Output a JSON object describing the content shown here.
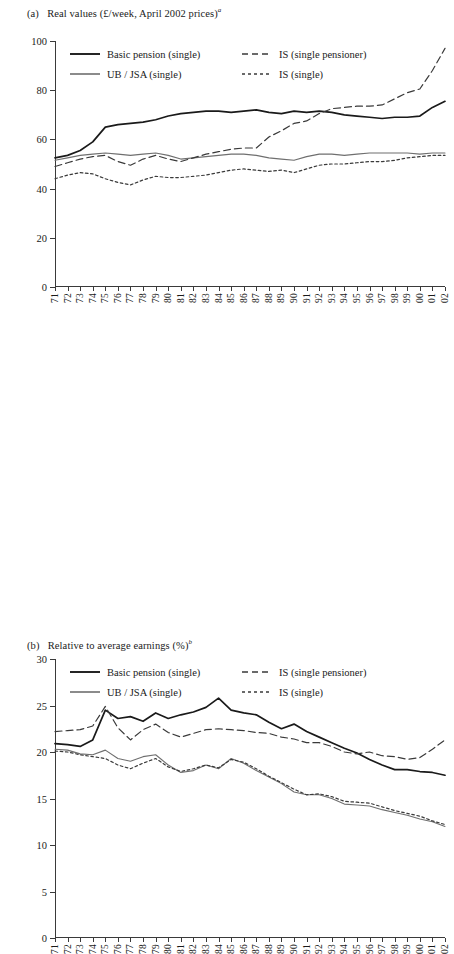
{
  "figure": {
    "panel_a_label": "(a)",
    "panel_a_title": "Real values (£/week, April 2002 prices)",
    "panel_a_superscript": "a",
    "panel_b_label": "(b)",
    "panel_b_title": "Relative to average earnings (%)",
    "panel_b_superscript": "b"
  },
  "legend": {
    "basic_pension": "Basic pension (single)",
    "ub_jsa": "UB / JSA (single)",
    "is_single_pensioner": "IS (single pensioner)",
    "is_single": "IS (single)"
  },
  "colors": {
    "basic_pension": "#1a1a1a",
    "ub_jsa": "#6f6f6f",
    "is_single_pensioner": "#3a3a3a",
    "is_single": "#3a3a3a",
    "axis": "#3a3a3a"
  },
  "chart_data": [
    {
      "id": "panel-a",
      "type": "line",
      "title": "Real values (£/week, April 2002 prices)",
      "xlabel": "",
      "ylabel": "",
      "ylim": [
        0,
        100
      ],
      "yticks": [
        0,
        20,
        40,
        60,
        80,
        100
      ],
      "xlim_categories": true,
      "grid": false,
      "legend_position": "top-left",
      "categories": [
        "71",
        "72",
        "73",
        "74",
        "75",
        "76",
        "77",
        "78",
        "79",
        "80",
        "81",
        "82",
        "83",
        "84",
        "85",
        "86",
        "87",
        "88",
        "89",
        "90",
        "91",
        "92",
        "93",
        "94",
        "95",
        "96",
        "97",
        "98",
        "99",
        "00",
        "01",
        "02"
      ],
      "series": [
        {
          "name": "Basic pension (single)",
          "style": "solid",
          "color": "#1a1a1a",
          "width": 1.7,
          "values": [
            52.5,
            53.5,
            55.5,
            59.0,
            65.0,
            66.0,
            66.5,
            67.0,
            68.0,
            69.5,
            70.5,
            71.0,
            71.5,
            71.5,
            71.0,
            71.5,
            72.0,
            71.0,
            70.5,
            71.5,
            71.0,
            71.5,
            71.0,
            70.0,
            69.5,
            69.0,
            68.5,
            69.0,
            69.0,
            69.5,
            73.0,
            75.5
          ]
        },
        {
          "name": "UB / JSA (single)",
          "style": "solid",
          "color": "#6f6f6f",
          "width": 1.1,
          "values": [
            51.5,
            52.5,
            53.5,
            54.0,
            54.5,
            54.0,
            53.5,
            54.0,
            54.5,
            53.5,
            52.0,
            52.5,
            53.0,
            53.5,
            54.0,
            54.0,
            53.5,
            52.5,
            52.0,
            51.5,
            53.0,
            54.0,
            54.0,
            53.5,
            54.0,
            54.5,
            54.5,
            54.5,
            54.5,
            54.0,
            54.5,
            54.5
          ]
        },
        {
          "name": "IS (single pensioner)",
          "style": "dashed",
          "color": "#3a3a3a",
          "width": 1.2,
          "values": [
            49.0,
            50.5,
            52.0,
            53.0,
            53.5,
            51.0,
            49.5,
            52.0,
            53.5,
            52.0,
            51.0,
            52.5,
            54.0,
            55.0,
            56.0,
            56.5,
            56.5,
            61.0,
            63.5,
            66.5,
            67.5,
            70.5,
            72.5,
            73.0,
            73.5,
            73.5,
            74.0,
            76.5,
            79.0,
            80.5,
            88.0,
            97.0
          ]
        },
        {
          "name": "IS (single)",
          "style": "dotted",
          "color": "#3a3a3a",
          "width": 1.2,
          "values": [
            44.0,
            45.5,
            46.5,
            46.0,
            44.0,
            42.5,
            41.5,
            43.5,
            45.0,
            44.5,
            44.5,
            45.0,
            45.5,
            46.5,
            47.5,
            48.0,
            47.5,
            47.0,
            47.5,
            46.5,
            48.0,
            49.5,
            50.0,
            50.0,
            50.5,
            51.0,
            51.0,
            51.5,
            52.5,
            53.0,
            53.5,
            53.5
          ]
        }
      ]
    },
    {
      "id": "panel-b",
      "type": "line",
      "title": "Relative to average earnings (%)",
      "xlabel": "",
      "ylabel": "",
      "ylim": [
        0,
        30
      ],
      "yticks": [
        0,
        5,
        10,
        15,
        20,
        25,
        30
      ],
      "grid": false,
      "legend_position": "top-left",
      "categories": [
        "71",
        "72",
        "73",
        "74",
        "75",
        "76",
        "77",
        "78",
        "79",
        "80",
        "81",
        "82",
        "83",
        "84",
        "85",
        "86",
        "87",
        "88",
        "89",
        "90",
        "91",
        "92",
        "93",
        "94",
        "95",
        "96",
        "97",
        "98",
        "99",
        "00",
        "01",
        "02"
      ],
      "series": [
        {
          "name": "Basic pension (single)",
          "style": "solid",
          "color": "#1a1a1a",
          "width": 1.7,
          "values": [
            20.9,
            20.8,
            20.6,
            21.3,
            24.5,
            23.6,
            23.8,
            23.3,
            24.2,
            23.6,
            24.0,
            24.3,
            24.8,
            25.8,
            24.5,
            24.2,
            24.0,
            23.2,
            22.5,
            23.0,
            22.2,
            21.6,
            21.0,
            20.4,
            19.9,
            19.2,
            18.6,
            18.1,
            18.1,
            17.9,
            17.8,
            17.5
          ]
        },
        {
          "name": "UB / JSA (single)",
          "style": "solid",
          "color": "#6f6f6f",
          "width": 1.1,
          "values": [
            20.3,
            20.2,
            19.8,
            19.7,
            20.2,
            19.3,
            19.0,
            19.5,
            19.7,
            18.6,
            17.8,
            18.0,
            18.6,
            18.2,
            19.3,
            18.8,
            18.0,
            17.3,
            16.6,
            15.7,
            15.4,
            15.4,
            15.0,
            14.4,
            14.3,
            14.2,
            13.8,
            13.5,
            13.2,
            12.8,
            12.5,
            12.0
          ]
        },
        {
          "name": "IS (single pensioner)",
          "style": "dashed",
          "color": "#3a3a3a",
          "width": 1.2,
          "values": [
            22.2,
            22.3,
            22.4,
            22.8,
            24.9,
            22.6,
            21.3,
            22.4,
            23.0,
            22.1,
            21.6,
            22.0,
            22.4,
            22.5,
            22.4,
            22.3,
            22.1,
            22.0,
            21.6,
            21.4,
            21.0,
            21.0,
            20.6,
            20.0,
            19.8,
            20.0,
            19.6,
            19.5,
            19.2,
            19.4,
            20.3,
            21.3
          ]
        },
        {
          "name": "IS (single)",
          "style": "dotted",
          "color": "#3a3a3a",
          "width": 1.2,
          "values": [
            20.1,
            20.0,
            19.7,
            19.5,
            19.3,
            18.6,
            18.2,
            18.8,
            19.3,
            18.4,
            17.9,
            18.2,
            18.6,
            18.3,
            19.2,
            18.9,
            18.2,
            17.4,
            16.7,
            16.0,
            15.4,
            15.5,
            15.2,
            14.7,
            14.6,
            14.5,
            14.1,
            13.7,
            13.4,
            13.1,
            12.6,
            12.2
          ]
        }
      ]
    }
  ]
}
